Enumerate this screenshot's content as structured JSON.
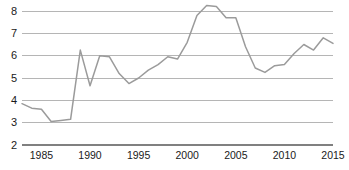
{
  "chart_data": {
    "type": "line",
    "title": "",
    "subtitle": "",
    "xlabel": "",
    "ylabel": "",
    "xlim": [
      1983,
      2015
    ],
    "ylim": [
      2,
      8.4
    ],
    "grid": true,
    "legend": null,
    "xticks": [
      1985,
      1990,
      1995,
      2000,
      2005,
      2010,
      2015
    ],
    "yticks": [
      2,
      3,
      4,
      5,
      6,
      7,
      8
    ],
    "gridline_values": [
      3,
      4,
      5,
      6,
      7,
      8
    ],
    "axis_baseline_value": 2,
    "series": [
      {
        "name": "series-1",
        "color": "#9b9b9b",
        "x": [
          1983,
          1984,
          1985,
          1986,
          1987,
          1988,
          1989,
          1990,
          1991,
          1992,
          1993,
          1994,
          1995,
          1996,
          1997,
          1998,
          1999,
          2000,
          2001,
          2002,
          2003,
          2004,
          2005,
          2006,
          2007,
          2008,
          2009,
          2010,
          2011,
          2012,
          2013,
          2014,
          2015
        ],
        "values": [
          3.85,
          3.65,
          3.6,
          3.05,
          3.1,
          3.15,
          6.25,
          4.65,
          6.0,
          5.95,
          5.2,
          4.75,
          5.0,
          5.35,
          5.6,
          5.95,
          5.85,
          6.6,
          7.8,
          8.25,
          8.2,
          7.7,
          7.7,
          6.4,
          5.45,
          5.25,
          5.55,
          5.6,
          6.1,
          6.5,
          6.25,
          6.8,
          6.55
        ]
      }
    ]
  },
  "axis": {
    "y_labels": [
      "8",
      "7",
      "6",
      "5",
      "4",
      "3",
      "2"
    ],
    "x_labels": [
      "1985",
      "1990",
      "1995",
      "2000",
      "2005",
      "2010",
      "2015"
    ]
  },
  "colors": {
    "line": "#9b9b9b",
    "gridline": "#b5b5b5",
    "baseline": "#808080",
    "text": "#1a1a1a",
    "background": "#ffffff"
  }
}
